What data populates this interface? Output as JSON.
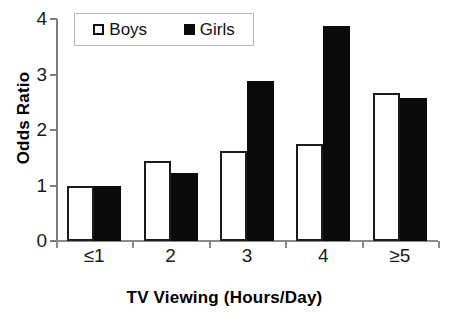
{
  "chart_data": {
    "type": "bar",
    "title": "",
    "xlabel": "TV Viewing (Hours/Day)",
    "ylabel": "Odds Ratio",
    "categories": [
      "≤1",
      "2",
      "3",
      "4",
      "≥5"
    ],
    "series": [
      {
        "name": "Boys",
        "values": [
          1.0,
          1.45,
          1.62,
          1.75,
          2.67
        ],
        "style": "open",
        "color": "#ffffff",
        "edge_color": "#1c1c1c"
      },
      {
        "name": "Girls",
        "values": [
          1.0,
          1.22,
          2.88,
          3.88,
          2.57
        ],
        "style": "filled",
        "color": "#0a0a0a",
        "edge_color": "#0a0a0a"
      }
    ],
    "ylim": [
      0,
      4
    ],
    "yticks": [
      0,
      1,
      2,
      3,
      4
    ],
    "ytick_labels": [
      "0",
      "1",
      "2",
      "3",
      "4"
    ],
    "grid": false,
    "legend_position": "upper left"
  },
  "legend": {
    "entries": [
      {
        "label": "Boys",
        "swatch": "open-square-icon"
      },
      {
        "label": "Girls",
        "swatch": "filled-square-icon"
      }
    ]
  },
  "axes": {
    "y_title": "Odds Ratio",
    "x_title": "TV Viewing (Hours/Day)"
  }
}
